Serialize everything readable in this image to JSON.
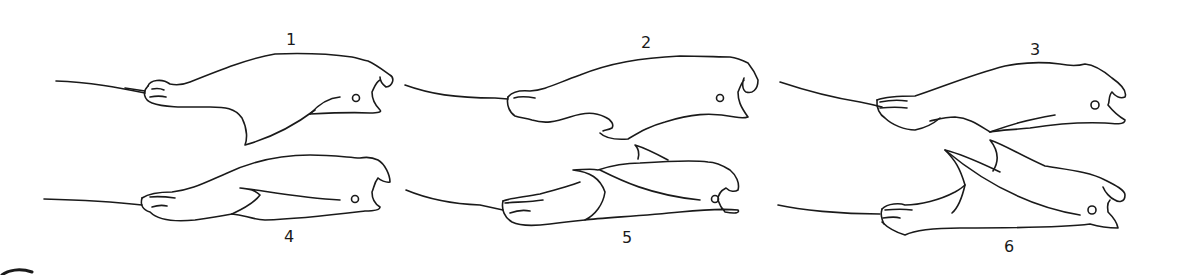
{
  "figure": {
    "panels": [
      {
        "label": "1",
        "row": "top",
        "column": "left"
      },
      {
        "label": "2",
        "row": "top",
        "column": "middle"
      },
      {
        "label": "3",
        "row": "top",
        "column": "right"
      },
      {
        "label": "4",
        "row": "bottom",
        "column": "left"
      },
      {
        "label": "5",
        "row": "bottom",
        "column": "middle"
      },
      {
        "label": "6",
        "row": "bottom",
        "column": "right"
      }
    ]
  }
}
